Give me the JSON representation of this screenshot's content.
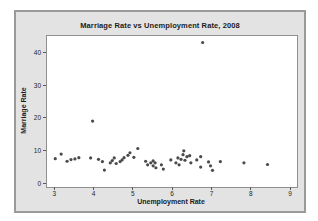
{
  "window": {
    "background": "#ffffff"
  },
  "panel": {
    "background": "#e3e3e3",
    "border_color": "#9a9a9a",
    "plot_background": "#ffffff",
    "plot_border_color": "#8f8f8f"
  },
  "chart_data": {
    "type": "scatter",
    "title": "Marriage Rate vs Unemployment Rate, 2008",
    "xlabel": "Unemployment Rate",
    "ylabel": "Marriage Rate",
    "xlim": [
      2.79,
      9.15
    ],
    "ylim": [
      -0.9,
      45.4
    ],
    "x_ticks": [
      3,
      4,
      5,
      6,
      7,
      8,
      9
    ],
    "y_ticks": [
      0,
      10,
      20,
      30,
      40
    ],
    "grid": false,
    "legend": false,
    "point_color": "#4a4a4a",
    "point_radius": 1.6,
    "points": [
      [
        3.0,
        7.8
      ],
      [
        3.15,
        9.2
      ],
      [
        3.3,
        7.0
      ],
      [
        3.4,
        7.5
      ],
      [
        3.5,
        7.7
      ],
      [
        3.6,
        8.1
      ],
      [
        3.9,
        8.0
      ],
      [
        3.95,
        19.3
      ],
      [
        4.1,
        7.6
      ],
      [
        4.2,
        6.9
      ],
      [
        4.25,
        4.3
      ],
      [
        4.4,
        6.5
      ],
      [
        4.45,
        7.2
      ],
      [
        4.5,
        8.0
      ],
      [
        4.55,
        6.3
      ],
      [
        4.65,
        6.9
      ],
      [
        4.7,
        7.4
      ],
      [
        4.75,
        8.1
      ],
      [
        4.85,
        8.8
      ],
      [
        4.9,
        9.6
      ],
      [
        5.0,
        8.2
      ],
      [
        5.1,
        10.9
      ],
      [
        5.3,
        7.0
      ],
      [
        5.35,
        5.9
      ],
      [
        5.43,
        6.5
      ],
      [
        5.49,
        7.1
      ],
      [
        5.49,
        5.6
      ],
      [
        5.54,
        6.5
      ],
      [
        5.56,
        5.0
      ],
      [
        5.7,
        5.9
      ],
      [
        5.75,
        4.6
      ],
      [
        5.94,
        7.4
      ],
      [
        6.07,
        6.5
      ],
      [
        6.12,
        8.0
      ],
      [
        6.15,
        5.9
      ],
      [
        6.2,
        7.6
      ],
      [
        6.25,
        9.0
      ],
      [
        6.27,
        10.2
      ],
      [
        6.3,
        7.3
      ],
      [
        6.35,
        8.4
      ],
      [
        6.42,
        8.7
      ],
      [
        6.45,
        6.5
      ],
      [
        6.6,
        7.4
      ],
      [
        6.7,
        8.4
      ],
      [
        6.7,
        5.2
      ],
      [
        6.75,
        43.4
      ],
      [
        6.9,
        6.8
      ],
      [
        6.95,
        5.6
      ],
      [
        7.0,
        4.2
      ],
      [
        7.2,
        6.9
      ],
      [
        7.8,
        6.5
      ],
      [
        8.4,
        6.0
      ]
    ]
  }
}
